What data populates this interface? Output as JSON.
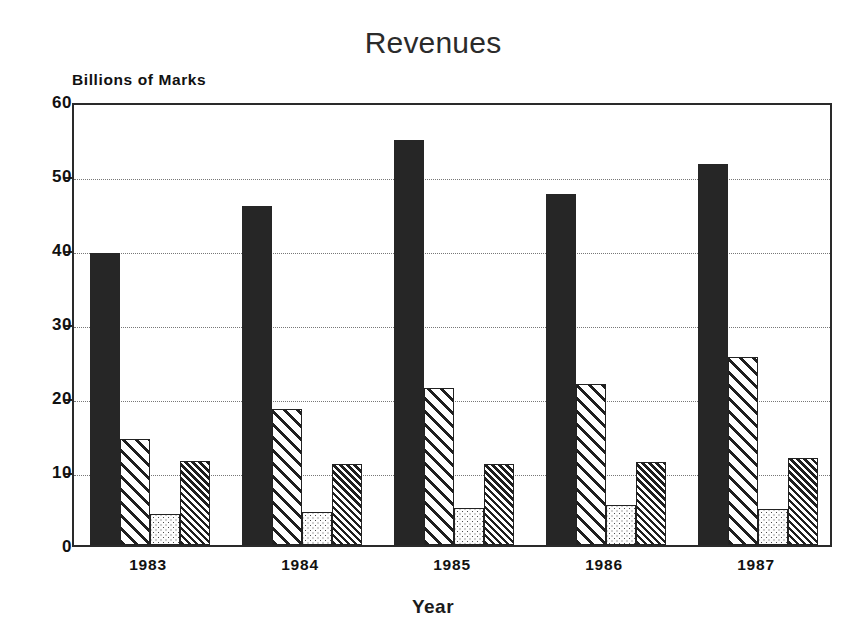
{
  "chart_data": {
    "type": "bar",
    "title": "Revenues",
    "xlabel": "Year",
    "ylabel": "Billions of Marks",
    "categories": [
      "1983",
      "1984",
      "1985",
      "1986",
      "1987"
    ],
    "ylim": [
      0,
      60
    ],
    "yticks": [
      0,
      10,
      20,
      30,
      40,
      50,
      60
    ],
    "ytick_labels": [
      "0",
      "10",
      "20",
      "30",
      "40",
      "50",
      "60"
    ],
    "grid": true,
    "legend": "none",
    "series": [
      {
        "name": "Series 1",
        "pattern": "solid-black",
        "values": [
          39.5,
          45.8,
          54.7,
          47.4,
          51.5
        ]
      },
      {
        "name": "Series 2",
        "pattern": "wide-diagonal-hatch",
        "values": [
          14.3,
          18.4,
          21.2,
          21.8,
          25.4
        ]
      },
      {
        "name": "Series 3",
        "pattern": "light-dots",
        "values": [
          4.2,
          4.4,
          5.0,
          5.4,
          4.8
        ]
      },
      {
        "name": "Series 4",
        "pattern": "dense-diagonal-hatch",
        "values": [
          11.4,
          11.0,
          10.9,
          11.2,
          11.8
        ]
      }
    ]
  },
  "colors": {
    "axis": "#2a2a2a",
    "grid": "#777777",
    "bar_solid": "#262626",
    "background": "#ffffff"
  }
}
